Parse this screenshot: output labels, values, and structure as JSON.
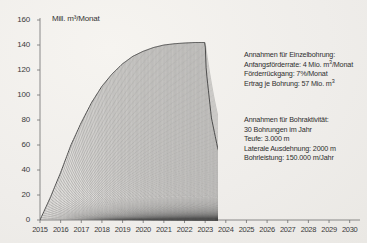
{
  "chart_data": {
    "type": "area",
    "title": "",
    "ylabel": "Mill. m³/Monat",
    "xlabel": "",
    "ylim": [
      0,
      160
    ],
    "yticks": [
      0,
      20,
      40,
      60,
      80,
      100,
      120,
      140,
      160
    ],
    "xlim": [
      2015,
      2030.5
    ],
    "xticks": [
      2015,
      2016,
      2017,
      2018,
      2019,
      2020,
      2021,
      2022,
      2023,
      2024,
      2025,
      2026,
      2027,
      2028,
      2029,
      2030
    ],
    "grid": false,
    "legend": "none",
    "series": [
      {
        "name": "Summe aller Bohrungen",
        "x": [
          2015.0,
          2015.5,
          2016.0,
          2016.5,
          2017.0,
          2017.5,
          2018.0,
          2018.5,
          2019.0,
          2019.5,
          2020.0,
          2020.5,
          2021.0,
          2021.5,
          2022.0,
          2022.5,
          2023.0,
          2023.05,
          2023.3,
          2023.6,
          2024.0,
          2024.5,
          2025.0,
          2025.5,
          2026.0,
          2026.5,
          2027.0,
          2027.5,
          2028.0,
          2029.0,
          2030.0
        ],
        "y": [
          0,
          18,
          38,
          60,
          78,
          94,
          107,
          117,
          125,
          131,
          135,
          138,
          140,
          141,
          141.6,
          142,
          142,
          120,
          82,
          58,
          36,
          22,
          14,
          9,
          6,
          4,
          2.8,
          2.0,
          1.4,
          0.7,
          0.35
        ]
      }
    ],
    "well_count": 30,
    "well_decline_per_month": 0.07,
    "well_initial_rate": 4
  },
  "annotations": {
    "block1": {
      "lines": [
        "Annahmen für Einzelbohrung:",
        "Anfangsförderrate: 4 Mio. m³/Monat",
        "Förderrückgang: 7%/Monat",
        "Ertrag je Bohrung: 57 Mio. m³"
      ]
    },
    "block2": {
      "lines": [
        "Annahmen für Bohraktivität:",
        "30 Bohrungen im Jahr",
        "Teufe: 3.000 m",
        "Laterale Ausdehnung: 2000 m",
        "Bohrleistung: 150.000 m/Jahr"
      ]
    }
  },
  "colors": {
    "background": "#efedea",
    "axis": "#6b6b6b",
    "text": "#2e2e2e",
    "curve": "#555555",
    "fill": "#8a8a8a"
  }
}
